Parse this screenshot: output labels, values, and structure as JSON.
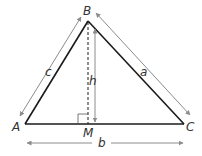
{
  "diagram": {
    "type": "triangle-with-altitude",
    "vertices": {
      "A": {
        "label": "A"
      },
      "B": {
        "label": "B"
      },
      "C": {
        "label": "C"
      },
      "M": {
        "label": "M"
      }
    },
    "sides": {
      "c": {
        "label": "c",
        "between": "A-B"
      },
      "a": {
        "label": "a",
        "between": "B-C"
      },
      "b": {
        "label": "b",
        "between": "A-C"
      }
    },
    "altitude": {
      "label": "h",
      "from": "B",
      "to": "M"
    },
    "right_angle_at": "M",
    "colors": {
      "triangle": "#1a1a1a",
      "arrows": "#8c8c8c",
      "labels": "#333333"
    }
  }
}
